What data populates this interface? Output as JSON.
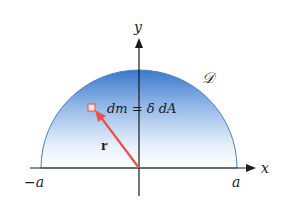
{
  "diagram": {
    "type": "semicircular-region-mass-element",
    "region_label": "𝒟",
    "mass_element_label": "dm = δ dA",
    "position_vector_label": "r",
    "axes": {
      "x_label": "x",
      "y_label": "y",
      "x_tick_left": "−a",
      "x_tick_right": "a"
    },
    "colors": {
      "fill_top": "#3f7fd0",
      "fill_bottom": "#ffffff",
      "boundary": "#4a7fc0",
      "vector": "#e8524a",
      "axis": "#1a1a1a"
    }
  }
}
